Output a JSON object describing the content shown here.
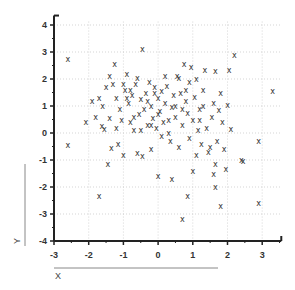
{
  "chart_data": {
    "type": "scatter",
    "title": "",
    "xlabel": "X",
    "ylabel": "Y",
    "xlim": [
      -3,
      3.55
    ],
    "ylim": [
      -4,
      4.35
    ],
    "xticks": [
      -3,
      -2,
      -1,
      0,
      1,
      2,
      3
    ],
    "yticks": [
      -4,
      -3,
      -2,
      -1,
      0,
      1,
      2,
      3,
      4
    ],
    "grid": true,
    "marker": "x",
    "series": [
      {
        "name": "points",
        "points": [
          [
            -2.6,
            2.75
          ],
          [
            -2.6,
            -0.45
          ],
          [
            -2.08,
            0.4
          ],
          [
            -1.62,
            0.25
          ],
          [
            -1.45,
            -1.15
          ],
          [
            -1.7,
            -2.35
          ],
          [
            -1.9,
            1.2
          ],
          [
            -1.7,
            1.3
          ],
          [
            -1.5,
            1.7
          ],
          [
            -1.4,
            2.1
          ],
          [
            -1.25,
            2.55
          ],
          [
            -1.6,
            1.0
          ],
          [
            -1.3,
            1.8
          ],
          [
            -1.2,
            1.3
          ],
          [
            -1.1,
            0.9
          ],
          [
            -1.05,
            0.5
          ],
          [
            -1.15,
            -0.4
          ],
          [
            -1.0,
            -0.8
          ],
          [
            -0.95,
            1.6
          ],
          [
            -0.9,
            2.2
          ],
          [
            -0.85,
            1.1
          ],
          [
            -0.8,
            0.4
          ],
          [
            -0.75,
            1.4
          ],
          [
            -0.7,
            0.1
          ],
          [
            -0.65,
            1.8
          ],
          [
            -0.6,
            2.05
          ],
          [
            -0.55,
            0.7
          ],
          [
            -0.5,
            1.25
          ],
          [
            -0.45,
            3.1
          ],
          [
            -0.4,
            0.9
          ],
          [
            -0.35,
            1.5
          ],
          [
            -0.3,
            0.3
          ],
          [
            -0.25,
            1.9
          ],
          [
            -0.2,
            1.0
          ],
          [
            -0.15,
            0.55
          ],
          [
            -0.1,
            1.7
          ],
          [
            -0.05,
            0.2
          ],
          [
            0.0,
            1.3
          ],
          [
            0.05,
            0.8
          ],
          [
            0.1,
            1.55
          ],
          [
            0.15,
            0.4
          ],
          [
            0.2,
            1.1
          ],
          [
            0.25,
            1.75
          ],
          [
            0.3,
            0.0
          ],
          [
            0.35,
            -0.3
          ],
          [
            0.4,
            0.95
          ],
          [
            0.45,
            1.4
          ],
          [
            0.5,
            0.6
          ],
          [
            0.55,
            2.1
          ],
          [
            0.6,
            2.05
          ],
          [
            0.65,
            1.5
          ],
          [
            0.7,
            0.3
          ],
          [
            0.75,
            2.55
          ],
          [
            0.8,
            1.2
          ],
          [
            0.85,
            0.75
          ],
          [
            0.9,
            1.9
          ],
          [
            0.95,
            2.45
          ],
          [
            1.0,
            0.5
          ],
          [
            1.05,
            1.35
          ],
          [
            1.1,
            2.0
          ],
          [
            1.15,
            0.1
          ],
          [
            1.2,
            0.9
          ],
          [
            1.3,
            1.6
          ],
          [
            1.35,
            2.35
          ],
          [
            1.4,
            0.2
          ],
          [
            1.5,
            -0.5
          ],
          [
            1.55,
            0.6
          ],
          [
            1.6,
            1.1
          ],
          [
            1.65,
            2.3
          ],
          [
            1.7,
            -0.3
          ],
          [
            1.8,
            1.5
          ],
          [
            1.85,
            0.4
          ],
          [
            1.9,
            -0.6
          ],
          [
            2.0,
            1.05
          ],
          [
            2.05,
            2.35
          ],
          [
            2.2,
            2.9
          ],
          [
            2.45,
            -1.05
          ],
          [
            2.9,
            -0.3
          ],
          [
            3.3,
            1.55
          ],
          [
            2.1,
            0.15
          ],
          [
            1.75,
            0.85
          ],
          [
            1.25,
            -0.4
          ],
          [
            0.9,
            -0.2
          ],
          [
            -1.35,
            -0.55
          ],
          [
            -0.6,
            -0.75
          ],
          [
            -0.45,
            -0.85
          ],
          [
            -0.2,
            -0.6
          ],
          [
            0.0,
            -1.6
          ],
          [
            0.4,
            -1.7
          ],
          [
            1.0,
            -1.4
          ],
          [
            1.6,
            -1.5
          ],
          [
            1.65,
            -2.0
          ],
          [
            0.85,
            -2.35
          ],
          [
            1.8,
            -2.7
          ],
          [
            2.9,
            -2.6
          ],
          [
            0.7,
            -3.2
          ],
          [
            1.65,
            -1.15
          ],
          [
            1.95,
            -1.35
          ],
          [
            2.4,
            -1.0
          ],
          [
            -1.8,
            0.6
          ],
          [
            -1.55,
            0.15
          ],
          [
            -1.4,
            0.55
          ],
          [
            -1.0,
            1.8
          ],
          [
            -0.8,
            1.6
          ],
          [
            -0.3,
            1.2
          ],
          [
            0.1,
            -0.1
          ],
          [
            0.3,
            0.5
          ],
          [
            0.6,
            -0.5
          ],
          [
            1.1,
            -0.8
          ],
          [
            1.45,
            -0.7
          ],
          [
            0.2,
            2.1
          ],
          [
            -0.2,
            0.3
          ],
          [
            -0.7,
            0.6
          ],
          [
            -1.2,
            0.2
          ],
          [
            0.5,
            1.0
          ],
          [
            1.3,
            1.0
          ],
          [
            0.7,
            0.9
          ],
          [
            -0.1,
            1.5
          ],
          [
            -0.5,
            0.1
          ],
          [
            1.2,
            0.5
          ],
          [
            0.0,
            0.7
          ],
          [
            -0.9,
            1.3
          ],
          [
            0.8,
            1.6
          ]
        ]
      }
    ]
  },
  "axes": {
    "x_tick_labels": [
      "-3",
      "-2",
      "-1",
      "0",
      "1",
      "2",
      "3"
    ],
    "y_tick_labels": [
      "-4",
      "-3",
      "-2",
      "-1",
      "0",
      "1",
      "2",
      "3",
      "4"
    ],
    "x_title": "X",
    "y_title": "Y"
  }
}
